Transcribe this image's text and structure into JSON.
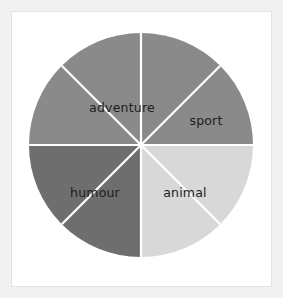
{
  "figure": {
    "background_color": "#f1f1f1",
    "panel_color": "#ffffff",
    "panel_border_color": "#e3e3e3"
  },
  "chart_data": {
    "type": "pie",
    "title": "",
    "subtitle": "",
    "xlabel": "",
    "ylabel": "",
    "grid": false,
    "legend": "none",
    "label_position": "inside",
    "start_angle_deg": 90,
    "direction": "clockwise",
    "total_sectors": 8,
    "sector_angle_deg": 45,
    "center_x": 141,
    "center_y": 145,
    "radius": 112,
    "divider_color": "#ffffff",
    "divider_width": 2.2,
    "label_color": "#1d1d1d",
    "categories": [
      "adventure",
      "sport",
      "animal",
      "humour"
    ],
    "values": [
      2,
      2,
      2,
      2
    ],
    "percentages": [
      25,
      25,
      25,
      25
    ],
    "colors": [
      "#8a8a8a",
      "#8a8a8a",
      "#d8d8d8",
      "#6e6e6e"
    ],
    "sectors": [
      {
        "label": "adventure",
        "color": "#8a8a8a",
        "start_deg": 90,
        "end_deg": 135,
        "show_label": false
      },
      {
        "label": "adventure",
        "color": "#8a8a8a",
        "start_deg": 135,
        "end_deg": 180,
        "show_label": false
      },
      {
        "label": "humour",
        "color": "#6e6e6e",
        "start_deg": 180,
        "end_deg": 225,
        "show_label": false
      },
      {
        "label": "humour",
        "color": "#6e6e6e",
        "start_deg": 225,
        "end_deg": 270,
        "show_label": false
      },
      {
        "label": "animal",
        "color": "#d8d8d8",
        "start_deg": 270,
        "end_deg": 315,
        "show_label": false
      },
      {
        "label": "animal",
        "color": "#d8d8d8",
        "start_deg": 315,
        "end_deg": 360,
        "show_label": false
      },
      {
        "label": "sport",
        "color": "#8a8a8a",
        "start_deg": 0,
        "end_deg": 45,
        "show_label": false
      },
      {
        "label": "sport",
        "color": "#8a8a8a",
        "start_deg": 45,
        "end_deg": 90,
        "show_label": false
      }
    ],
    "labels": [
      {
        "text": "adventure",
        "x": 122,
        "y": 108,
        "anchor": "middle"
      },
      {
        "text": "sport",
        "x": 206,
        "y": 121,
        "anchor": "middle"
      },
      {
        "text": "humour",
        "x": 95,
        "y": 193,
        "anchor": "middle"
      },
      {
        "text": "animal",
        "x": 185,
        "y": 193,
        "anchor": "middle"
      }
    ]
  }
}
